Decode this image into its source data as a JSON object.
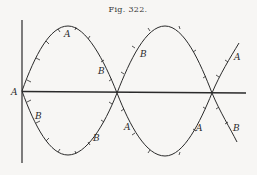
{
  "figure": {
    "caption": "Fig. 322.",
    "labels": {
      "origin": "A",
      "a_peak1": "A",
      "b_desc1": "B",
      "b_lower1": "B",
      "b_lower2": "B",
      "b_rise2": "B",
      "a_lower2": "A",
      "a_lower3": "A",
      "a_end": "A",
      "b_end": "B"
    },
    "colors": {
      "ink": "#2a2a2a",
      "paper": "#f7f6f4"
    }
  }
}
